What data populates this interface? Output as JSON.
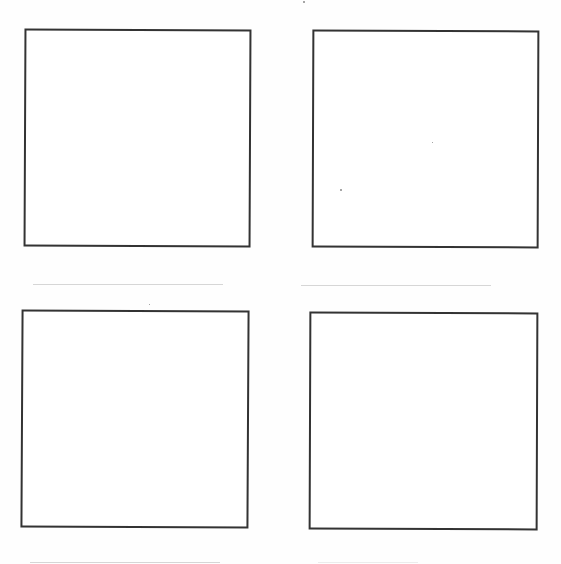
{
  "document": {
    "type": "blank storyboard / drawing template sheet",
    "layout": "2x2 grid of hand-drawn empty frames with caption lines",
    "frame_stroke_color": "#333333",
    "caption_line_color": "#d6d6d6",
    "background_color": "#ffffff"
  },
  "frames": [
    {
      "id": 1,
      "content": "",
      "caption": ""
    },
    {
      "id": 2,
      "content": "",
      "caption": ""
    },
    {
      "id": 3,
      "content": "",
      "caption": ""
    },
    {
      "id": 4,
      "content": "",
      "caption": ""
    }
  ]
}
